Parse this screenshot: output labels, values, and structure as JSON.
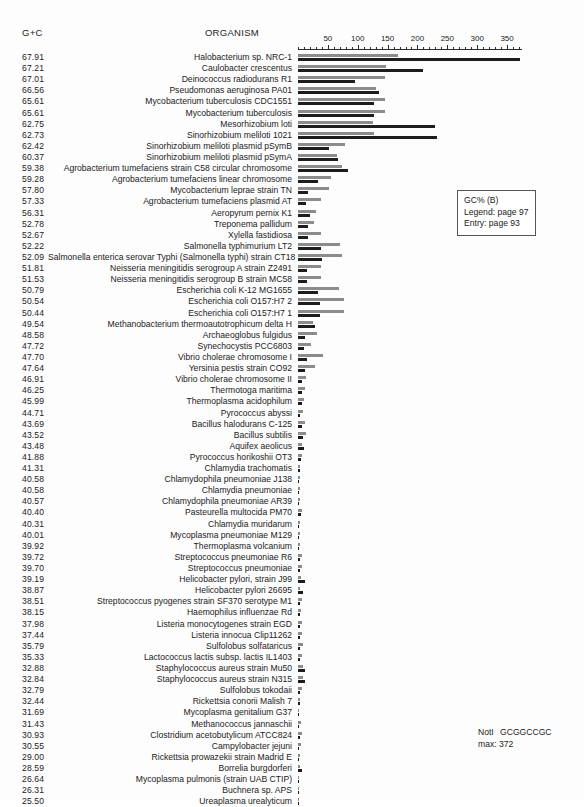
{
  "header": {
    "gc_column_label": "G+C",
    "organism_column_label": "ORGANISM"
  },
  "legend_box": {
    "title": "GC% (B)",
    "legend_ref": "Legend: page 97",
    "entry_ref": "Entry: page 93"
  },
  "note": {
    "enzyme_name": "NotI",
    "enzyme_site": "GCGGCCGC",
    "max_label": "max: 372"
  },
  "chart_data": {
    "type": "bar",
    "orientation": "horizontal",
    "title": "GC% (B)",
    "xlabel": "",
    "ylabel": "",
    "xlim": [
      0,
      375
    ],
    "grid": false,
    "legend_position": "right",
    "axis_ticks_major": [
      50,
      100,
      150,
      200,
      250,
      300,
      350
    ],
    "axis_tick_labels": [
      "50",
      "100",
      "150",
      "200",
      "250",
      "300",
      "350"
    ],
    "axis_tick_minor_step": 10,
    "max_value": 372,
    "series": [
      {
        "name": "gray-bar",
        "color": "#8c8c8c"
      },
      {
        "name": "black-bar",
        "color": "#1d1d1d"
      }
    ],
    "categories": [
      "Halobacterium sp. NRC-1",
      "Caulobacter crescentus",
      "Deinococcus radiodurans R1",
      "Pseudomonas aeruginosa PA01",
      "Mycobacterium tuberculosis CDC1551",
      "Mycobacterium tuberculosis",
      "Mesorhizobium loti",
      "Sinorhizobium meliloti 1021",
      "Sinorhizobium meliloti plasmid pSymB",
      "Sinorhizobium meliloti plasmid pSymA",
      "Agrobacterium tumefaciens strain C58 circular chromosome",
      "Agrobacterium tumefaciens linear chromosome",
      "Mycobacterium leprae strain TN",
      "Agrobacterium tumefaciens plasmid AT",
      "Aeropyrum pernix K1",
      "Treponema pallidum",
      "Xylella fastidiosa",
      "Salmonella typhimurium LT2",
      "Salmonella enterica serovar Typhi (Salmonella typhi) strain CT18",
      "Neisseria meningitidis serogroup A strain Z2491",
      "Neisseria meningitidis serogroup B strain MC58",
      "Escherichia coli K-12 MG1655",
      "Escherichia coli O157:H7 2",
      "Escherichia coli O157:H7 1",
      "Methanobacterium thermoautotrophicum delta H",
      "Archaeoglobus fulgidus",
      "Synechocystis PCC6803",
      "Vibrio cholerae chromosome I",
      "Yersinia pestis strain CO92",
      "Vibrio cholerae chromosome II",
      "Thermotoga maritima",
      "Thermoplasma acidophilum",
      "Pyrococcus abyssi",
      "Bacillus halodurans C-125",
      "Bacillus subtilis",
      "Aquifex aeolicus",
      "Pyrococcus horikoshii OT3",
      "Chlamydia trachomatis",
      "Chlamydophila pneumoniae J138",
      "Chlamydia pneumoniae",
      "Chlamydophila pneumoniae AR39",
      "Pasteurella multocida PM70",
      "Chlamydia muridarum",
      "Mycoplasma pneumoniae M129",
      "Thermoplasma volcanium",
      "Streptococcus pneumoniae R6",
      "Streptococcus pneumoniae",
      "Helicobacter pylori, strain J99",
      "Helicobacter pylori 26695",
      "Streptococcus pyogenes strain SF370 serotype M1",
      "Haemophilus influenzae Rd",
      "Listeria monocytogenes strain EGD",
      "Listeria innocua Clip11262",
      "Sulfolobus solfataricus",
      "Lactococcus lactis subsp. lactis IL1403",
      "Staphylococcus aureus strain Mu50",
      "Staphylococcus aureus strain N315",
      "Sulfolobus tokodaii",
      "Rickettsia conorii Malish 7",
      "Mycoplasma genitalium G37",
      "Methanococcus jannaschii",
      "Clostridium acetobutylicum ATCC824",
      "Campylobacter jejuni",
      "Rickettsia prowazekii strain Madrid E",
      "Borrelia burgdorferi",
      "Mycoplasma pulmonis (strain UAB CTIP)",
      "Buchnera sp. APS",
      "Ureaplasma urealyticum"
    ],
    "gc_values": [
      67.91,
      67.21,
      67.01,
      66.56,
      65.61,
      65.61,
      62.75,
      62.73,
      62.42,
      60.37,
      59.38,
      59.28,
      57.8,
      57.33,
      56.31,
      52.78,
      52.67,
      52.22,
      52.09,
      51.81,
      51.53,
      50.79,
      50.54,
      50.44,
      49.54,
      48.58,
      47.72,
      47.7,
      47.64,
      46.91,
      46.25,
      45.99,
      44.71,
      43.69,
      43.52,
      43.48,
      41.88,
      41.31,
      40.58,
      40.58,
      40.57,
      40.4,
      40.31,
      40.01,
      39.92,
      39.72,
      39.7,
      39.19,
      38.87,
      38.51,
      38.15,
      37.98,
      37.44,
      35.79,
      35.33,
      32.88,
      32.84,
      32.79,
      32.44,
      31.69,
      31.43,
      30.93,
      30.55,
      29.0,
      28.59,
      26.64,
      26.31,
      25.5
    ],
    "gray_values": [
      168,
      148,
      145,
      130,
      145,
      145,
      125,
      127,
      79,
      66,
      74,
      56,
      52,
      38,
      30,
      27,
      39,
      70,
      73,
      38,
      38,
      69,
      77,
      77,
      25,
      31,
      21,
      42,
      28,
      14,
      11,
      10,
      8,
      12,
      13,
      6,
      7,
      4,
      4,
      4,
      4,
      6,
      4,
      3,
      4,
      6,
      6,
      5,
      4,
      6,
      5,
      6,
      6,
      8,
      6,
      8,
      8,
      6,
      4,
      2,
      5,
      7,
      5,
      3,
      3,
      2,
      2,
      2
    ],
    "black_values": [
      372,
      209,
      95,
      135,
      128,
      128,
      229,
      232,
      52,
      67,
      83,
      34,
      16,
      14,
      20,
      17,
      16,
      38,
      40,
      15,
      15,
      34,
      37,
      37,
      29,
      12,
      10,
      15,
      11,
      7,
      6,
      6,
      4,
      7,
      8,
      10,
      5,
      3,
      2,
      2,
      2,
      5,
      2,
      2,
      2,
      4,
      4,
      12,
      8,
      4,
      4,
      3,
      3,
      4,
      3,
      12,
      11,
      3,
      3,
      1,
      2,
      3,
      2,
      2,
      7,
      1,
      1,
      1
    ]
  }
}
